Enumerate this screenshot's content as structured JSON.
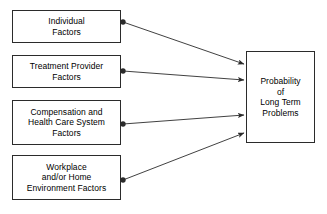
{
  "diagram": {
    "background_color": "#ffffff",
    "line_color": "#2b2b2b",
    "border_color": "#2b2b2b",
    "text_color": "#000000",
    "source_nodes": [
      {
        "id": "individual-factors",
        "label": "Individual\nFactors",
        "x": 12,
        "y": 10,
        "w": 109,
        "h": 33
      },
      {
        "id": "treatment-provider-factors",
        "label": "Treatment Provider\nFactors",
        "x": 12,
        "y": 55,
        "w": 109,
        "h": 33
      },
      {
        "id": "compensation-health-care-system-factors",
        "label": "Compensation and\nHealth Care System\nFactors",
        "x": 12,
        "y": 100,
        "w": 109,
        "h": 45
      },
      {
        "id": "workplace-home-environment-factors",
        "label": "Workplace\nand/or Home\nEnvironment Factors",
        "x": 12,
        "y": 155,
        "w": 109,
        "h": 45
      }
    ],
    "target_node": {
      "id": "probability-long-term-problems",
      "label": "Probability\nof\nLong Term\nProblems",
      "x": 246,
      "y": 51,
      "w": 69,
      "h": 92
    },
    "edges": [
      {
        "id": "edge-individual",
        "from": "individual-factors",
        "to": "probability-long-term-problems",
        "x1": 123,
        "y1": 22,
        "x2": 244,
        "y2": 64,
        "marker_start": "dot",
        "marker_end": "arrowhead"
      },
      {
        "id": "edge-treatment-provider",
        "from": "treatment-provider-factors",
        "to": "probability-long-term-problems",
        "x1": 123,
        "y1": 71,
        "x2": 244,
        "y2": 80,
        "marker_start": "dot",
        "marker_end": "arrowhead"
      },
      {
        "id": "edge-compensation",
        "from": "compensation-health-care-system-factors",
        "to": "probability-long-term-problems",
        "x1": 123,
        "y1": 124,
        "x2": 244,
        "y2": 115,
        "marker_start": "dot",
        "marker_end": "arrowhead"
      },
      {
        "id": "edge-workplace",
        "from": "workplace-home-environment-factors",
        "to": "probability-long-term-problems",
        "x1": 123,
        "y1": 180,
        "x2": 244,
        "y2": 133,
        "marker_start": "dot",
        "marker_end": "arrowhead"
      }
    ]
  }
}
